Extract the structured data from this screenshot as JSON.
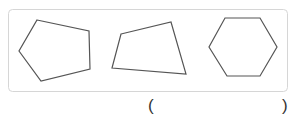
{
  "answer_blank": {
    "open": "(",
    "close": ")"
  },
  "shapes": [
    {
      "name": "pentagon",
      "points": "37,20 89,31 90,69 41,81 19,51"
    },
    {
      "name": "quadrilateral",
      "points": "121,34 171,22 186,74 112,68"
    },
    {
      "name": "hexagon",
      "points": "225,18 260,18 277,47 260,76 227,76 209,47"
    }
  ],
  "colors": {
    "stroke": "#555555",
    "frame": "#d6d6d6"
  }
}
